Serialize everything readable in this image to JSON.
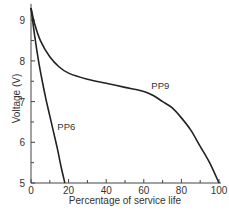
{
  "chart_data": {
    "type": "line",
    "title": "",
    "xlabel": "Percentage of service life",
    "ylabel": "Voltage (V)",
    "xlim": [
      0,
      100
    ],
    "ylim": [
      5,
      9.4
    ],
    "x_ticks": [
      0,
      20,
      40,
      60,
      80,
      100
    ],
    "x_minor_ticks": [
      10,
      30,
      50,
      70,
      90
    ],
    "y_ticks": [
      5,
      6,
      7,
      8,
      9
    ],
    "y_minor_ticks": [
      5.5,
      6.5,
      7.5,
      8.5
    ],
    "grid": false,
    "legend": "none (curves labeled inline)",
    "series": [
      {
        "name": "PP9",
        "x": [
          0,
          2,
          5,
          10,
          15,
          20,
          30,
          40,
          50,
          60,
          65,
          70,
          75,
          80,
          85,
          90,
          95,
          100
        ],
        "y": [
          9.3,
          8.9,
          8.5,
          8.1,
          7.85,
          7.7,
          7.55,
          7.45,
          7.35,
          7.25,
          7.15,
          7.0,
          6.85,
          6.6,
          6.3,
          5.9,
          5.5,
          5.0
        ],
        "label_position": {
          "x": 64,
          "y": 7.3
        }
      },
      {
        "name": "PP6",
        "x": [
          0,
          2,
          4,
          6,
          8,
          10,
          12,
          14,
          16,
          18
        ],
        "y": [
          9.3,
          8.6,
          8.0,
          7.5,
          7.05,
          6.65,
          6.25,
          5.85,
          5.4,
          5.0
        ],
        "label_position": {
          "x": 14,
          "y": 6.3
        }
      }
    ]
  },
  "axes": {
    "xlabel": "Percentage of service life",
    "ylabel": "Voltage (V)"
  }
}
